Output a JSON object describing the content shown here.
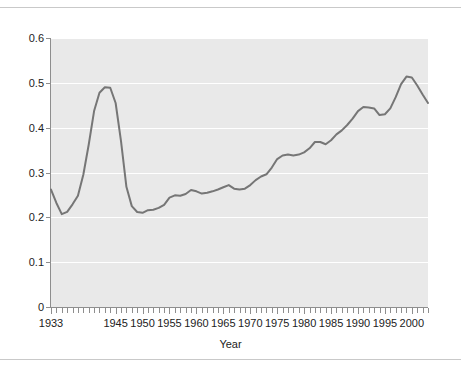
{
  "figure": {
    "background_color": "#ffffff",
    "rule_color": "#c9c9c9",
    "has_top_rule": true,
    "has_bottom_rule": true
  },
  "chart_data": {
    "type": "line",
    "title": "",
    "subtitle": "",
    "xlabel": "Year",
    "ylabel": "",
    "xlim": [
      1933,
      2003
    ],
    "ylim": [
      0,
      0.6
    ],
    "grid": true,
    "grid_axis": "y",
    "grid_color": "#ffffff",
    "plot_background": "#e9e9e9",
    "legend": null,
    "legend_position": "none",
    "line_color": "#767676",
    "line_width": 2,
    "y_ticks": [
      0,
      0.1,
      0.2,
      0.3,
      0.4,
      0.5,
      0.6
    ],
    "y_tick_labels": [
      "0",
      "0.1",
      "0.2",
      "0.3",
      "0.4",
      "0.5",
      "0.6"
    ],
    "x_ticks_minor_every": 1,
    "x_tick_labels": [
      "1933",
      "1945",
      "1950",
      "1955",
      "1960",
      "1965",
      "1970",
      "1975",
      "1980",
      "1985",
      "1990",
      "1995",
      "2000"
    ],
    "x_tick_label_values": [
      1933,
      1945,
      1950,
      1955,
      1960,
      1965,
      1970,
      1975,
      1980,
      1985,
      1990,
      1995,
      2000
    ],
    "x": [
      1933,
      1934,
      1935,
      1936,
      1937,
      1938,
      1939,
      1940,
      1941,
      1942,
      1943,
      1944,
      1945,
      1946,
      1947,
      1948,
      1949,
      1950,
      1951,
      1952,
      1953,
      1954,
      1955,
      1956,
      1957,
      1958,
      1959,
      1960,
      1961,
      1962,
      1963,
      1964,
      1965,
      1966,
      1967,
      1968,
      1969,
      1970,
      1971,
      1972,
      1973,
      1974,
      1975,
      1976,
      1977,
      1978,
      1979,
      1980,
      1981,
      1982,
      1983,
      1984,
      1985,
      1986,
      1987,
      1988,
      1989,
      1990,
      1991,
      1992,
      1993,
      1994,
      1995,
      1996,
      1997,
      1998,
      1999,
      2000,
      2001,
      2002,
      2003
    ],
    "values": [
      0.262,
      0.232,
      0.207,
      0.212,
      0.229,
      0.248,
      0.295,
      0.362,
      0.437,
      0.478,
      0.49,
      0.489,
      0.455,
      0.37,
      0.268,
      0.225,
      0.212,
      0.21,
      0.216,
      0.217,
      0.221,
      0.228,
      0.244,
      0.249,
      0.248,
      0.252,
      0.261,
      0.258,
      0.253,
      0.255,
      0.258,
      0.262,
      0.267,
      0.272,
      0.264,
      0.262,
      0.264,
      0.272,
      0.283,
      0.291,
      0.296,
      0.311,
      0.33,
      0.338,
      0.34,
      0.338,
      0.34,
      0.345,
      0.354,
      0.368,
      0.368,
      0.363,
      0.372,
      0.385,
      0.394,
      0.406,
      0.42,
      0.437,
      0.446,
      0.445,
      0.443,
      0.428,
      0.43,
      0.443,
      0.468,
      0.497,
      0.514,
      0.512,
      0.494,
      0.474,
      0.455
    ],
    "values_tail": [
      0.455,
      0.439,
      0.43,
      0.418,
      0.407,
      0.402,
      0.398
    ],
    "annotations": [],
    "notable_points": [
      {
        "label": "wartime peak",
        "x": 1943,
        "y": 0.49
      },
      {
        "label": "postwar trough",
        "x": 1950,
        "y": 0.21
      },
      {
        "label": "modern peak",
        "x": 1999,
        "y": 0.514
      }
    ]
  },
  "axes": {
    "x_title": "Year"
  }
}
